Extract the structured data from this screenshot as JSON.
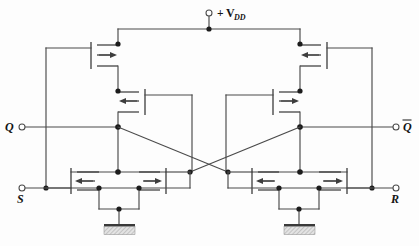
{
  "figure": {
    "kind": "circuit-schematic",
    "background_color": "#fdfdfd",
    "wire_color": "#4a4a4a",
    "symbol_color": "#3d3d3d",
    "node_color": "#1c1c1c",
    "label_color": "#141414"
  },
  "labels": {
    "supply": {
      "plus": "+",
      "symbol": "V",
      "subscript": "DD",
      "full": "+ VDD"
    },
    "q_output": "Q",
    "qbar_output": "Q",
    "qbar_has_overline": true,
    "set_input": "S",
    "reset_input": "R"
  },
  "terminals": [
    {
      "name": "vdd-terminal",
      "label": "+ VDD",
      "x": 209,
      "y": 13,
      "r": 3.0
    },
    {
      "name": "q-terminal",
      "label": "Q",
      "x": 22,
      "y": 127,
      "r": 3.0
    },
    {
      "name": "qbar-terminal",
      "label": "Q",
      "x": 396,
      "y": 127,
      "r": 3.0
    },
    {
      "name": "s-terminal",
      "label": "S",
      "x": 22,
      "y": 188,
      "r": 3.0
    },
    {
      "name": "r-terminal",
      "label": "R",
      "x": 396,
      "y": 188,
      "r": 3.0
    }
  ],
  "transistors": [
    {
      "name": "pmos-top-left",
      "type": "PMOS",
      "row": "top",
      "side": "left",
      "arrow_direction": "right"
    },
    {
      "name": "pmos-top-right",
      "type": "PMOS",
      "row": "top",
      "side": "right",
      "arrow_direction": "left"
    },
    {
      "name": "pmos-mid-left",
      "type": "PMOS",
      "row": "middle",
      "side": "left",
      "arrow_direction": "left"
    },
    {
      "name": "pmos-mid-right",
      "type": "PMOS",
      "row": "middle",
      "side": "right",
      "arrow_direction": "right"
    },
    {
      "name": "nmos-bottom-left-outer",
      "type": "NMOS",
      "row": "bottom",
      "side": "left",
      "arrow_direction": "left"
    },
    {
      "name": "nmos-bottom-left-inner",
      "type": "NMOS",
      "row": "bottom",
      "side": "left",
      "arrow_direction": "right"
    },
    {
      "name": "nmos-bottom-right-outer",
      "type": "NMOS",
      "row": "bottom",
      "side": "right",
      "arrow_direction": "left"
    },
    {
      "name": "nmos-bottom-right-inner",
      "type": "NMOS",
      "row": "bottom",
      "side": "right",
      "arrow_direction": "right"
    }
  ],
  "grounds": [
    {
      "name": "ground-left",
      "x": 125,
      "y": 225
    },
    {
      "name": "ground-right",
      "x": 293,
      "y": 225
    }
  ],
  "nodes": [
    {
      "name": "node-vdd-rail",
      "x": 209,
      "y": 29
    },
    {
      "name": "node-pmos-top-left-d",
      "x": 118,
      "y": 44
    },
    {
      "name": "node-pmos-top-right-d",
      "x": 300,
      "y": 44
    },
    {
      "name": "node-pmos-mid-left-d",
      "x": 118,
      "y": 91
    },
    {
      "name": "node-pmos-mid-right-d",
      "x": 300,
      "y": 91
    },
    {
      "name": "node-q",
      "x": 118,
      "y": 127
    },
    {
      "name": "node-qbar",
      "x": 300,
      "y": 127
    },
    {
      "name": "node-left-drain",
      "x": 118,
      "y": 172
    },
    {
      "name": "node-right-drain",
      "x": 300,
      "y": 172
    },
    {
      "name": "node-cross-left",
      "x": 190,
      "y": 172
    },
    {
      "name": "node-cross-right",
      "x": 228,
      "y": 172
    },
    {
      "name": "node-s-rail",
      "x": 46,
      "y": 188
    },
    {
      "name": "node-r-rail",
      "x": 372,
      "y": 188
    },
    {
      "name": "node-nmos-l-g1",
      "x": 99,
      "y": 188
    },
    {
      "name": "node-nmos-l-g2",
      "x": 139,
      "y": 188
    },
    {
      "name": "node-nmos-r-g1",
      "x": 279,
      "y": 188
    },
    {
      "name": "node-nmos-r-g2",
      "x": 319,
      "y": 188
    },
    {
      "name": "node-gnd-left",
      "x": 119,
      "y": 209
    },
    {
      "name": "node-gnd-right",
      "x": 299,
      "y": 209
    }
  ],
  "connections": {
    "vdd_rail_span": {
      "x1": 118,
      "x2": 300,
      "y": 29
    },
    "left_feedback_rail_x": 46,
    "right_feedback_rail_x": 372,
    "cross_couple": [
      {
        "from": "node-q",
        "to": "node-cross-right"
      },
      {
        "from": "node-qbar",
        "to": "node-cross-left"
      }
    ]
  }
}
